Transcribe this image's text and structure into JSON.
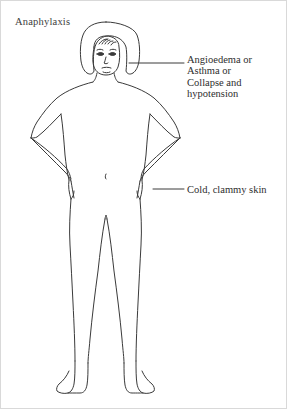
{
  "canvas": {
    "width": 287,
    "height": 409,
    "background": "#ffffff",
    "border_color": "#d9d9d9"
  },
  "diagram": {
    "title": "Anaphylaxis",
    "stroke_color": "#3a3a3a",
    "stroke_width": 1,
    "fill": "#ffffff"
  },
  "callouts": [
    {
      "id": "callout-1",
      "target": "head-and-airway",
      "lines": [
        "Angioedema or",
        "Asthma or",
        "Collapse and",
        "hypotension"
      ],
      "leader": {
        "x1": 128,
        "y1": 62,
        "x2": 183,
        "y2": 62
      },
      "text_x": 186,
      "text_y": 53
    },
    {
      "id": "callout-2",
      "target": "skin-at-hip",
      "lines": [
        "Cold, clammy skin"
      ],
      "leader": {
        "x1": 152,
        "y1": 188,
        "x2": 183,
        "y2": 188
      },
      "text_x": 186,
      "text_y": 183
    }
  ]
}
